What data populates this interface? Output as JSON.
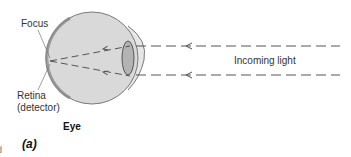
{
  "labels": {
    "focus": "Focus",
    "retina_line1": "Retina",
    "retina_line2": "(detector)",
    "eye": "Eye",
    "incoming_light": "Incoming light",
    "panel": "(a)",
    "edge_fragment": "d"
  },
  "colors": {
    "eyeball_fill": "#d9d9d9",
    "eyeball_stroke": "#7a7a7a",
    "retina": "#8c8c8c",
    "lens_fill": "#b3b3b3",
    "ray": "#555555"
  }
}
